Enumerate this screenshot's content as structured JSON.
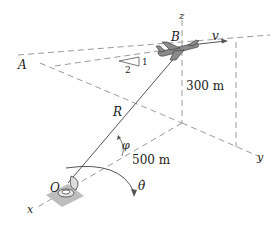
{
  "diagram": {
    "labels": {
      "point_A": "A",
      "point_B": "B",
      "point_O": "O",
      "velocity": "v",
      "axis_x": "x",
      "axis_y": "y",
      "axis_z": "z",
      "range": "R",
      "elevation_angle": "φ",
      "azimuth_rate": "θ̇",
      "height": "300 m",
      "horizontal_distance": "500 m",
      "slope_run": "2",
      "slope_rise": "1"
    },
    "colors": {
      "line": "#555555",
      "dashed": "#9a9a9a",
      "text": "#222222",
      "ground_patch": "#bdbdbd"
    }
  }
}
